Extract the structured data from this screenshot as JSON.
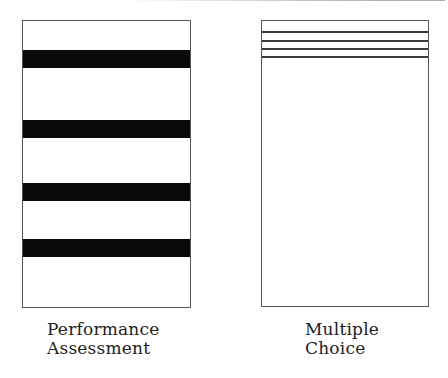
{
  "figure": {
    "panels": [
      {
        "id": "performance-assessment",
        "caption_lines": [
          "Performance",
          "Assessment"
        ],
        "bands": [
          {
            "top": 29,
            "height": 18
          },
          {
            "top": 99,
            "height": 18
          },
          {
            "top": 162,
            "height": 18
          },
          {
            "top": 218,
            "height": 18
          }
        ]
      },
      {
        "id": "multiple-choice",
        "caption_lines": [
          "Multiple",
          "Choice"
        ],
        "lines": [
          {
            "top": 10
          },
          {
            "top": 19
          },
          {
            "top": 27
          },
          {
            "top": 35
          }
        ]
      }
    ],
    "colors": {
      "band": "#0a0a0a",
      "border": "#555555",
      "line": "#3a3a3a",
      "text": "#222222"
    }
  }
}
